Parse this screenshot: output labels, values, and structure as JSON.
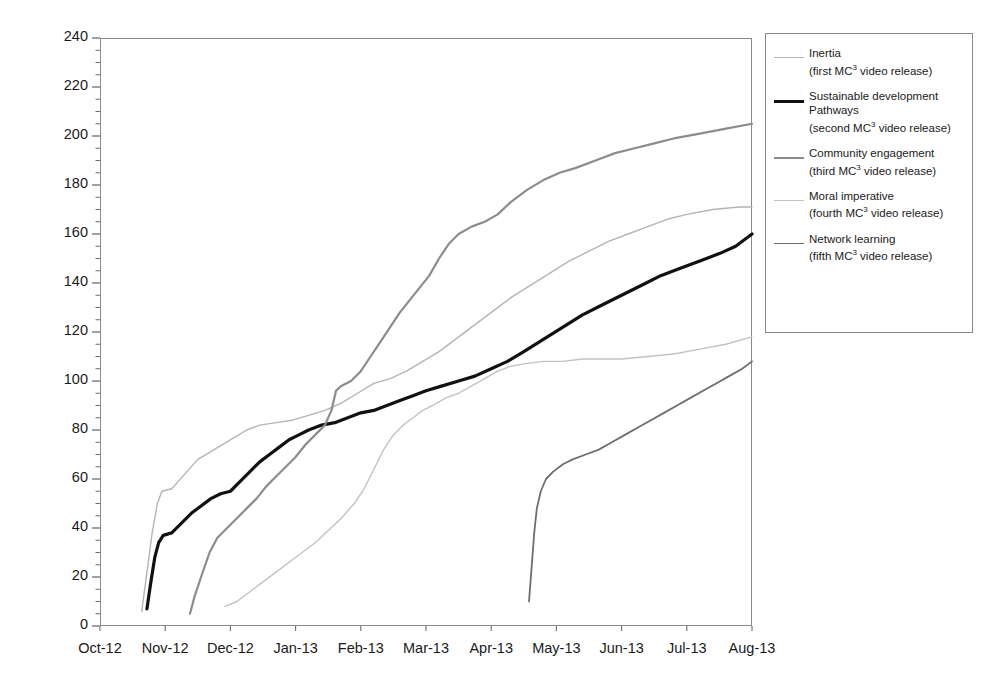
{
  "chart_data": {
    "type": "line",
    "title": "",
    "xlabel": "",
    "ylabel": "Video views (cumulative values)",
    "ylim": [
      0,
      240
    ],
    "ytick_step": 20,
    "yticks": [
      0,
      20,
      40,
      60,
      80,
      100,
      120,
      140,
      160,
      180,
      200,
      220,
      240
    ],
    "minor_ticks": true,
    "grid": false,
    "legend_position": "right",
    "categories": [
      "Oct-12",
      "Nov-12",
      "Dec-12",
      "Jan-13",
      "Feb-13",
      "Mar-13",
      "Apr-13",
      "May-13",
      "Jun-13",
      "Jul-13",
      "Aug-13"
    ],
    "x_unit": "month",
    "series": [
      {
        "name": "Inertia",
        "sublabel": "(first MC3 video release)",
        "release_order": "first",
        "color": "#b4b4b4",
        "width": 1.4,
        "points": [
          [
            0.64,
            6
          ],
          [
            0.72,
            22
          ],
          [
            0.8,
            38
          ],
          [
            0.88,
            50
          ],
          [
            0.95,
            55
          ],
          [
            1.1,
            56
          ],
          [
            1.3,
            62
          ],
          [
            1.5,
            68
          ],
          [
            1.75,
            72
          ],
          [
            2.0,
            76
          ],
          [
            2.25,
            80
          ],
          [
            2.45,
            82
          ],
          [
            2.7,
            83
          ],
          [
            2.95,
            84
          ],
          [
            3.2,
            86
          ],
          [
            3.45,
            88
          ],
          [
            3.7,
            91
          ],
          [
            3.95,
            95
          ],
          [
            4.2,
            99
          ],
          [
            4.45,
            101
          ],
          [
            4.7,
            104
          ],
          [
            4.95,
            108
          ],
          [
            5.2,
            112
          ],
          [
            5.45,
            117
          ],
          [
            5.7,
            122
          ],
          [
            6.0,
            128
          ],
          [
            6.3,
            134
          ],
          [
            6.6,
            139
          ],
          [
            6.9,
            144
          ],
          [
            7.2,
            149
          ],
          [
            7.5,
            153
          ],
          [
            7.8,
            157
          ],
          [
            8.1,
            160
          ],
          [
            8.4,
            163
          ],
          [
            8.7,
            166
          ],
          [
            9.0,
            168
          ],
          [
            9.4,
            170
          ],
          [
            9.8,
            171
          ],
          [
            10.0,
            171
          ]
        ]
      },
      {
        "name": "Sustainable development Pathways",
        "sublabel": "(second MC3 video release)",
        "release_order": "second",
        "color": "#111111",
        "width": 3.2,
        "points": [
          [
            0.72,
            7
          ],
          [
            0.78,
            18
          ],
          [
            0.84,
            28
          ],
          [
            0.9,
            34
          ],
          [
            0.97,
            37
          ],
          [
            1.1,
            38
          ],
          [
            1.25,
            42
          ],
          [
            1.4,
            46
          ],
          [
            1.55,
            49
          ],
          [
            1.7,
            52
          ],
          [
            1.85,
            54
          ],
          [
            2.0,
            55
          ],
          [
            2.15,
            59
          ],
          [
            2.3,
            63
          ],
          [
            2.45,
            67
          ],
          [
            2.6,
            70
          ],
          [
            2.75,
            73
          ],
          [
            2.9,
            76
          ],
          [
            3.05,
            78
          ],
          [
            3.2,
            80
          ],
          [
            3.4,
            82
          ],
          [
            3.6,
            83
          ],
          [
            3.8,
            85
          ],
          [
            4.0,
            87
          ],
          [
            4.2,
            88
          ],
          [
            4.4,
            90
          ],
          [
            4.6,
            92
          ],
          [
            4.8,
            94
          ],
          [
            5.0,
            96
          ],
          [
            5.25,
            98
          ],
          [
            5.5,
            100
          ],
          [
            5.75,
            102
          ],
          [
            6.0,
            105
          ],
          [
            6.25,
            108
          ],
          [
            6.5,
            112
          ],
          [
            6.8,
            117
          ],
          [
            7.1,
            122
          ],
          [
            7.4,
            127
          ],
          [
            7.7,
            131
          ],
          [
            8.0,
            135
          ],
          [
            8.3,
            139
          ],
          [
            8.6,
            143
          ],
          [
            8.9,
            146
          ],
          [
            9.2,
            149
          ],
          [
            9.5,
            152
          ],
          [
            9.75,
            155
          ],
          [
            10.0,
            160
          ]
        ]
      },
      {
        "name": "Community engagement",
        "sublabel": "(third MC3 video release)",
        "release_order": "third",
        "color": "#8c8c8c",
        "width": 2.2,
        "points": [
          [
            1.38,
            5
          ],
          [
            1.45,
            12
          ],
          [
            1.55,
            20
          ],
          [
            1.68,
            30
          ],
          [
            1.8,
            36
          ],
          [
            1.95,
            40
          ],
          [
            2.1,
            44
          ],
          [
            2.25,
            48
          ],
          [
            2.4,
            52
          ],
          [
            2.55,
            57
          ],
          [
            2.7,
            61
          ],
          [
            2.85,
            65
          ],
          [
            3.0,
            69
          ],
          [
            3.15,
            74
          ],
          [
            3.3,
            78
          ],
          [
            3.45,
            82
          ],
          [
            3.55,
            88
          ],
          [
            3.62,
            96
          ],
          [
            3.7,
            98
          ],
          [
            3.85,
            100
          ],
          [
            4.0,
            104
          ],
          [
            4.15,
            110
          ],
          [
            4.3,
            116
          ],
          [
            4.45,
            122
          ],
          [
            4.6,
            128
          ],
          [
            4.75,
            133
          ],
          [
            4.9,
            138
          ],
          [
            5.05,
            143
          ],
          [
            5.2,
            150
          ],
          [
            5.35,
            156
          ],
          [
            5.5,
            160
          ],
          [
            5.7,
            163
          ],
          [
            5.9,
            165
          ],
          [
            6.1,
            168
          ],
          [
            6.3,
            173
          ],
          [
            6.55,
            178
          ],
          [
            6.8,
            182
          ],
          [
            7.05,
            185
          ],
          [
            7.3,
            187
          ],
          [
            7.6,
            190
          ],
          [
            7.9,
            193
          ],
          [
            8.2,
            195
          ],
          [
            8.5,
            197
          ],
          [
            8.8,
            199
          ],
          [
            9.2,
            201
          ],
          [
            9.6,
            203
          ],
          [
            10.0,
            205
          ]
        ]
      },
      {
        "name": "Moral imperative",
        "sublabel": "(fourth MC3 video release)",
        "release_order": "fourth",
        "color": "#c2c2c2",
        "width": 1.4,
        "points": [
          [
            1.92,
            8
          ],
          [
            2.1,
            10
          ],
          [
            2.3,
            14
          ],
          [
            2.5,
            18
          ],
          [
            2.7,
            22
          ],
          [
            2.9,
            26
          ],
          [
            3.1,
            30
          ],
          [
            3.3,
            34
          ],
          [
            3.5,
            39
          ],
          [
            3.7,
            44
          ],
          [
            3.9,
            50
          ],
          [
            4.05,
            56
          ],
          [
            4.2,
            64
          ],
          [
            4.35,
            72
          ],
          [
            4.5,
            78
          ],
          [
            4.65,
            82
          ],
          [
            4.8,
            85
          ],
          [
            4.95,
            88
          ],
          [
            5.1,
            90
          ],
          [
            5.3,
            93
          ],
          [
            5.5,
            95
          ],
          [
            5.7,
            98
          ],
          [
            5.9,
            101
          ],
          [
            6.1,
            104
          ],
          [
            6.3,
            106
          ],
          [
            6.5,
            107
          ],
          [
            6.8,
            108
          ],
          [
            7.1,
            108
          ],
          [
            7.4,
            109
          ],
          [
            7.7,
            109
          ],
          [
            8.0,
            109
          ],
          [
            8.4,
            110
          ],
          [
            8.8,
            111
          ],
          [
            9.2,
            113
          ],
          [
            9.6,
            115
          ],
          [
            10.0,
            118
          ]
        ]
      },
      {
        "name": "Network learning",
        "sublabel": "(fifth MC3 video release)",
        "release_order": "fifth",
        "color": "#6e6e6e",
        "width": 1.8,
        "points": [
          [
            6.58,
            10
          ],
          [
            6.62,
            24
          ],
          [
            6.66,
            38
          ],
          [
            6.7,
            48
          ],
          [
            6.76,
            55
          ],
          [
            6.84,
            60
          ],
          [
            6.95,
            63
          ],
          [
            7.1,
            66
          ],
          [
            7.25,
            68
          ],
          [
            7.45,
            70
          ],
          [
            7.65,
            72
          ],
          [
            7.85,
            75
          ],
          [
            8.05,
            78
          ],
          [
            8.25,
            81
          ],
          [
            8.45,
            84
          ],
          [
            8.65,
            87
          ],
          [
            8.85,
            90
          ],
          [
            9.05,
            93
          ],
          [
            9.25,
            96
          ],
          [
            9.45,
            99
          ],
          [
            9.65,
            102
          ],
          [
            9.85,
            105
          ],
          [
            10.0,
            108
          ]
        ]
      }
    ]
  }
}
